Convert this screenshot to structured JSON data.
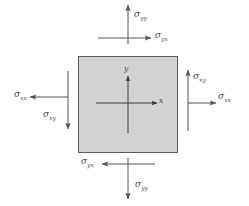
{
  "figure": {
    "element": {
      "name": "stress-square",
      "fill_color": "#d2d2d2",
      "border_color": "#5a5a5a",
      "x": 78,
      "y": 56,
      "width": 100,
      "height": 97
    },
    "colors": {
      "arrow": "#555555",
      "axis": "#3a3a3a",
      "background": "#ffffff",
      "label": "#4a4a4a"
    },
    "axes": [
      {
        "name": "x-axis",
        "label": "x",
        "direction": "right"
      },
      {
        "name": "y-axis",
        "label": "y",
        "direction": "up"
      }
    ],
    "stresses": [
      {
        "name": "sigma-yy-top",
        "symbol": "σ",
        "sub": "yy",
        "face": "top",
        "direction": "up",
        "label_x": 134,
        "label_y": 10
      },
      {
        "name": "sigma-yx-top",
        "symbol": "σ",
        "sub": "yx",
        "face": "top",
        "direction": "right",
        "label_x": 155,
        "label_y": 31
      },
      {
        "name": "sigma-xx-left",
        "symbol": "σ",
        "sub": "xx",
        "face": "left",
        "direction": "left",
        "label_x": 14,
        "label_y": 90
      },
      {
        "name": "sigma-xy-left",
        "symbol": "σ",
        "sub": "xy",
        "face": "left",
        "direction": "down",
        "label_x": 43,
        "label_y": 110
      },
      {
        "name": "sigma-xy-right",
        "symbol": "σ",
        "sub": "xy",
        "face": "right",
        "direction": "up",
        "label_x": 193,
        "label_y": 72
      },
      {
        "name": "sigma-xx-right",
        "symbol": "σ",
        "sub": "xx",
        "face": "right",
        "direction": "right",
        "label_x": 218,
        "label_y": 92
      },
      {
        "name": "sigma-yx-bottom",
        "symbol": "σ",
        "sub": "yx",
        "face": "bottom",
        "direction": "left",
        "label_x": 81,
        "label_y": 157
      },
      {
        "name": "sigma-yy-bottom",
        "symbol": "σ",
        "sub": "yy",
        "face": "bottom",
        "direction": "down",
        "label_x": 135,
        "label_y": 180
      }
    ]
  }
}
